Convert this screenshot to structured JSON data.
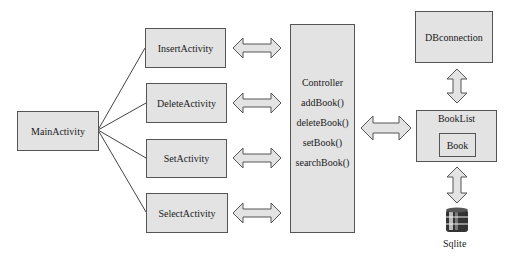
{
  "diagram": {
    "main_activity": {
      "label": "MainActivity"
    },
    "activities": [
      {
        "label": "InsertActivity"
      },
      {
        "label": "DeleteActivity"
      },
      {
        "label": "SetActivity"
      },
      {
        "label": "SelectActivity"
      }
    ],
    "controller": {
      "title": "Controller",
      "methods": [
        "addBook()",
        "deleteBook()",
        "setBook()",
        "searchBook()"
      ]
    },
    "dbconnection": {
      "label": "DBconnection"
    },
    "booklist": {
      "label": "BookList",
      "inner": {
        "label": "Book"
      }
    },
    "database": {
      "label": "Sqlite",
      "icon": "database-icon"
    },
    "colors": {
      "box_fill": "#e3e3e3",
      "border": "#555555",
      "arrow_fill": "#e3e3e3"
    }
  }
}
